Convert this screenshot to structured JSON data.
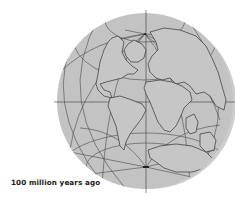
{
  "map": {
    "title": "Paleogeographic globe",
    "caption": "100 million years ago",
    "projection": "orthographic globe with graticule",
    "colors": {
      "background": "#ffffff",
      "globe_fill": "#c4c4c4",
      "globe_rim": "#cfcfcf",
      "coastline": "#3a3a3a",
      "graticule": "#4a4a4a",
      "caption_text": "#1a1a1a"
    },
    "globe": {
      "center": [
        145,
        101
      ],
      "radius": 88,
      "north_pole": [
        145,
        34
      ],
      "south_pole": [
        146,
        167
      ]
    },
    "landmasses": [
      "North America",
      "Greenland",
      "Europe",
      "Asia",
      "Africa",
      "South America",
      "India",
      "Australia",
      "Antarctica"
    ]
  }
}
